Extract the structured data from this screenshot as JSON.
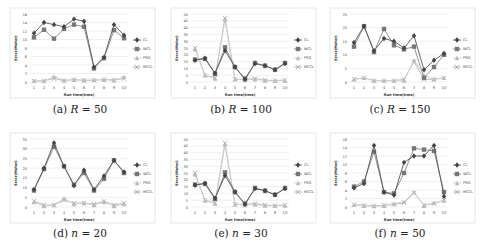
{
  "legend": [
    "CL",
    "WCL",
    "PSO",
    "MCCL"
  ],
  "xlabel": "Run time(time)",
  "ylabel": "Error(Meter)",
  "chart_data": [
    {
      "type": "line",
      "caption": "(a) R = 50",
      "caption_prefix": "(a)",
      "caption_var": "R",
      "caption_val": "= 50",
      "categories": [
        1,
        2,
        3,
        4,
        5,
        6,
        7,
        8,
        9,
        10
      ],
      "ylim": [
        0,
        16
      ],
      "yticks": [
        0,
        2,
        4,
        6,
        8,
        10,
        12,
        14,
        16
      ],
      "xlabel": "Run time(time)",
      "ylabel": "Error(Meter)",
      "series": [
        {
          "name": "CL",
          "values": [
            11.5,
            14,
            13.5,
            13,
            14.8,
            14.3,
            3.5,
            5.8,
            13.5,
            11
          ]
        },
        {
          "name": "WCL",
          "values": [
            10.5,
            12.3,
            10.2,
            12.5,
            13.5,
            13,
            3.2,
            5.6,
            12.2,
            10.3
          ]
        },
        {
          "name": "PSO",
          "values": [
            0.3,
            0.2,
            1.3,
            0.4,
            0.5,
            0.4,
            0.5,
            0.5,
            0.4,
            1.2
          ]
        },
        {
          "name": "MCCL",
          "values": [
            0.2,
            0.3,
            0.8,
            0.3,
            0.6,
            0.4,
            0.4,
            0.6,
            0.5,
            0.8
          ]
        }
      ]
    },
    {
      "type": "line",
      "caption": "(b) R = 100",
      "caption_prefix": "(b)",
      "caption_var": "R",
      "caption_val": "= 100",
      "categories": [
        1,
        2,
        3,
        4,
        5,
        6,
        7,
        8,
        9,
        10
      ],
      "ylim": [
        0,
        50
      ],
      "yticks": [
        0,
        5,
        10,
        15,
        20,
        25,
        30,
        35,
        40,
        45,
        50
      ],
      "xlabel": "Run time(time)",
      "ylabel": "Error(Meter)",
      "series": [
        {
          "name": "CL",
          "values": [
            16,
            17.5,
            6.5,
            23,
            11,
            2,
            13.5,
            12,
            9,
            13.5
          ]
        },
        {
          "name": "WCL",
          "values": [
            16.5,
            17,
            6,
            25.5,
            11,
            2.5,
            14,
            12,
            9,
            14
          ]
        },
        {
          "name": "PSO",
          "values": [
            24,
            5,
            2.5,
            46,
            2,
            1.5,
            2,
            1,
            1,
            1
          ]
        },
        {
          "name": "MCCL",
          "values": [
            25,
            5,
            3,
            47,
            2,
            2,
            2.5,
            1.5,
            1,
            1.5
          ]
        }
      ]
    },
    {
      "type": "line",
      "caption": "(c) R = 150",
      "caption_prefix": "(c)",
      "caption_var": "R",
      "caption_val": "= 150",
      "categories": [
        1,
        2,
        3,
        4,
        5,
        6,
        7,
        8,
        9,
        10
      ],
      "ylim": [
        0,
        25
      ],
      "yticks": [
        0,
        5,
        10,
        15,
        20,
        25
      ],
      "xlabel": "Run time(time)",
      "ylabel": "Error(Meter)",
      "series": [
        {
          "name": "CL",
          "values": [
            14.5,
            20.5,
            11.5,
            16,
            15,
            12.5,
            17,
            4.5,
            8,
            10.5
          ]
        },
        {
          "name": "WCL",
          "values": [
            13,
            20.5,
            11,
            19.5,
            13.5,
            12,
            13,
            1.5,
            5.5,
            10
          ]
        },
        {
          "name": "PSO",
          "values": [
            1,
            1.5,
            0.5,
            0.5,
            0.5,
            0.5,
            8,
            2.5,
            1,
            1.5
          ]
        },
        {
          "name": "MCCL",
          "values": [
            1,
            1.5,
            0.5,
            0.5,
            0.5,
            1,
            7.5,
            1,
            1,
            1.5
          ]
        }
      ]
    },
    {
      "type": "line",
      "caption": "(d) n = 20",
      "caption_prefix": "(d)",
      "caption_var": "n",
      "caption_val": "= 20",
      "categories": [
        1,
        2,
        3,
        4,
        5,
        6,
        7,
        8,
        9,
        10
      ],
      "ylim": [
        0,
        35
      ],
      "yticks": [
        0,
        5,
        10,
        15,
        20,
        25,
        30,
        35
      ],
      "xlabel": "Run time(time)",
      "ylabel": "Error(Meter)",
      "series": [
        {
          "name": "CL",
          "values": [
            9,
            20,
            33,
            21,
            11,
            19,
            9,
            16,
            24,
            18
          ]
        },
        {
          "name": "WCL",
          "values": [
            8.5,
            19.5,
            31,
            21,
            11.5,
            17.5,
            8.5,
            14.5,
            24,
            17.5
          ]
        },
        {
          "name": "PSO",
          "values": [
            2.5,
            0.5,
            1,
            4.5,
            1.5,
            2,
            1,
            2.5,
            0.5,
            1.5
          ]
        },
        {
          "name": "MCCL",
          "values": [
            3,
            1,
            1,
            3.5,
            2,
            2,
            1.5,
            3,
            1,
            2
          ]
        }
      ]
    },
    {
      "type": "line",
      "caption": "(e) n = 30",
      "caption_prefix": "(e)",
      "caption_var": "n",
      "caption_val": "= 30",
      "categories": [
        1,
        2,
        3,
        4,
        5,
        6,
        7,
        8,
        9,
        10
      ],
      "ylim": [
        0,
        50
      ],
      "yticks": [
        0,
        5,
        10,
        15,
        20,
        25,
        30,
        35,
        40,
        45,
        50
      ],
      "xlabel": "Run time(time)",
      "ylabel": "Error(Meter)",
      "series": [
        {
          "name": "CL",
          "values": [
            16,
            17.5,
            6.5,
            23,
            11,
            2,
            13.5,
            12,
            9,
            13.5
          ]
        },
        {
          "name": "WCL",
          "values": [
            16.5,
            17,
            6,
            25.5,
            11,
            2.5,
            14,
            12,
            9,
            14
          ]
        },
        {
          "name": "PSO",
          "values": [
            24,
            5,
            2.5,
            46,
            2,
            1.5,
            2,
            1,
            1,
            1
          ]
        },
        {
          "name": "MCCL",
          "values": [
            25,
            5,
            3,
            47,
            2,
            2,
            2.5,
            1.5,
            1,
            1.5
          ]
        }
      ]
    },
    {
      "type": "line",
      "caption": "(f) n = 50",
      "caption_prefix": "(f)",
      "caption_var": "n",
      "caption_val": "= 50",
      "categories": [
        1,
        2,
        3,
        4,
        5,
        6,
        7,
        8,
        9,
        10
      ],
      "ylim": [
        0,
        16
      ],
      "yticks": [
        0,
        2,
        4,
        6,
        8,
        10,
        12,
        14,
        16
      ],
      "xlabel": "Run time(time)",
      "ylabel": "Error(Meter)",
      "series": [
        {
          "name": "CL",
          "values": [
            4.5,
            5.5,
            14.5,
            3.5,
            2.8,
            10.5,
            12,
            12,
            14.5,
            2.5
          ]
        },
        {
          "name": "WCL",
          "values": [
            4.8,
            6,
            13,
            3.5,
            3.2,
            8,
            13.8,
            13.5,
            13.2,
            3.5
          ]
        },
        {
          "name": "PSO",
          "values": [
            0.5,
            0.3,
            0.2,
            0.3,
            0.8,
            1.2,
            3.5,
            0.3,
            1,
            1.5
          ]
        },
        {
          "name": "MCCL",
          "values": [
            0.6,
            0.4,
            0.3,
            0.4,
            0.6,
            1,
            3.3,
            0.5,
            0.8,
            1.6
          ]
        }
      ]
    }
  ]
}
